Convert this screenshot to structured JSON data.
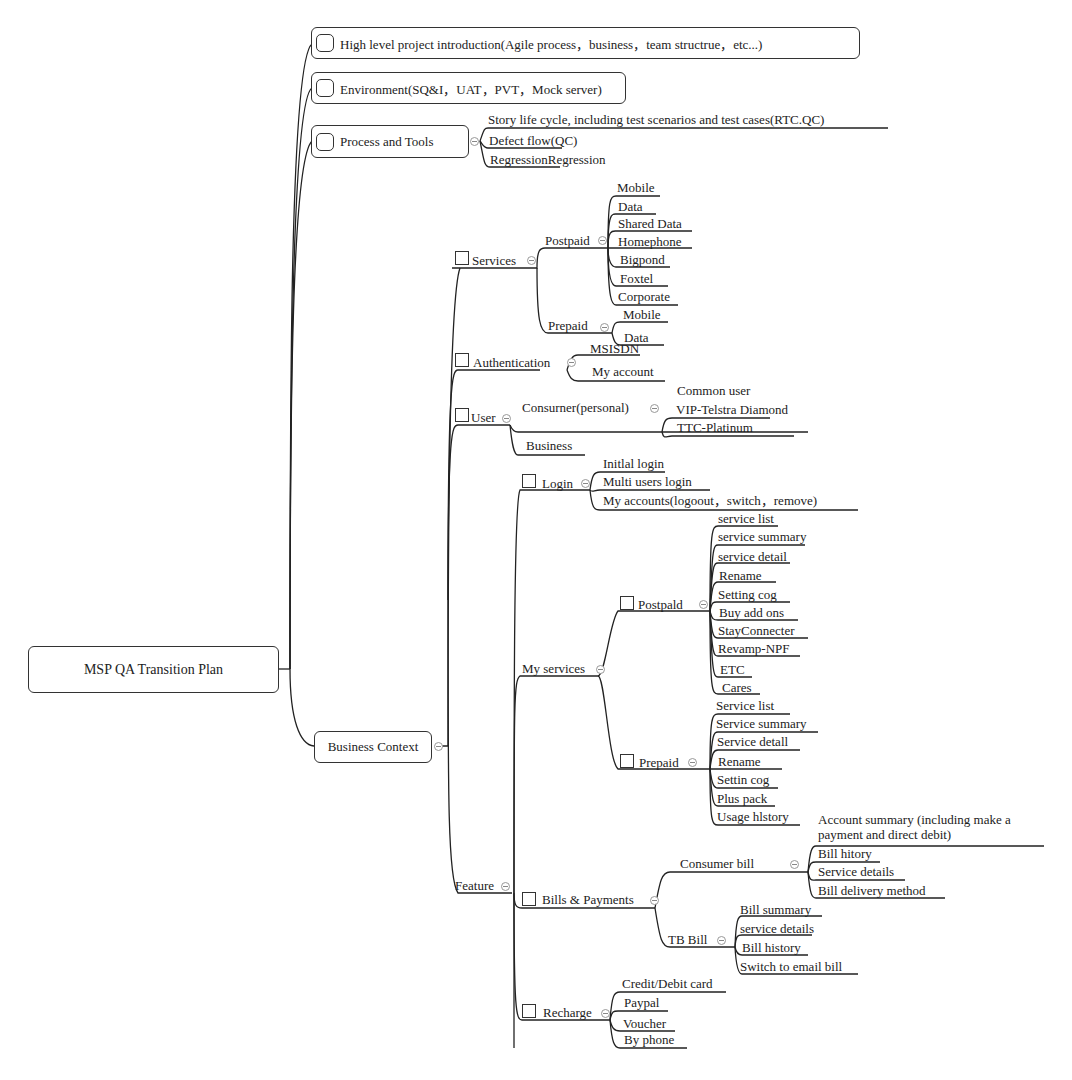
{
  "root": {
    "label": "MSP QA Transition Plan"
  },
  "level1": {
    "intro": "High level project introduction(Agile process，business，team structrue，etc...)",
    "environment": "Environment(SQ&I，UAT，PVT，Mock server)",
    "process": "Process and Tools",
    "business": "Business Context"
  },
  "process_children": [
    "Story life cycle, including test scenarios and test cases(RTC.QC)",
    "Defect flow(QC)",
    "RegressionRegression"
  ],
  "services": {
    "label": "Services",
    "postpaid": {
      "label": "Postpaid",
      "items": [
        "Mobile",
        "Data",
        "Shared Data",
        "Homephone",
        "Bigpond",
        "Foxtel",
        "Corporate"
      ]
    },
    "prepaid": {
      "label": "Prepaid",
      "items": [
        "Mobile",
        "Data"
      ]
    }
  },
  "authentication": {
    "label": "Authentication",
    "items": [
      "MSISDN",
      "My account"
    ]
  },
  "user": {
    "label": "User",
    "consumer": {
      "label": "Consurner(personal)",
      "items": [
        "Common user",
        "VIP-Telstra Diamond",
        "TTC-Platinum"
      ]
    },
    "business": "Business"
  },
  "feature": {
    "label": "Feature",
    "login": {
      "label": "Login",
      "items": [
        "Initlal login",
        "Multi users login",
        "My accounts(logoout，switch，remove)"
      ]
    },
    "my_services": {
      "label": "My services",
      "postpaid": {
        "label": "Postpald",
        "items": [
          "service list",
          "service summary",
          "service detail",
          "Rename",
          "Setting cog",
          "Buy add ons",
          "StayConnecter",
          "Revamp-NPF",
          "ETC",
          "Cares"
        ]
      },
      "prepaid": {
        "label": "Prepaid",
        "items": [
          "Service list",
          "Service summary",
          "Service detall",
          "Rename",
          "Settin cog",
          "Plus pack",
          "Usage hlstory"
        ]
      }
    },
    "bills": {
      "label": "Bills & Payments",
      "consumer": {
        "label": "Consumer bill",
        "items": [
          "Account summary (including make a payment and direct debit)",
          "Bill hitory",
          "Service details",
          "Bill delivery method"
        ]
      },
      "tb": {
        "label": "TB Bill",
        "items": [
          "Bill summary",
          "service details",
          "Bill history",
          "Switch to email bill"
        ]
      }
    },
    "recharge": {
      "label": "Recharge",
      "items": [
        "Credit/Debit card",
        "Paypal",
        "Voucher",
        "By phone"
      ]
    }
  }
}
